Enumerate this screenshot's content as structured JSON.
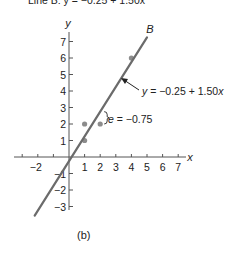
{
  "chart_data": {
    "type": "scatter",
    "title": "",
    "caption": "(b)",
    "xlabel": "x",
    "ylabel": "y",
    "xlim": [
      -3,
      7.5
    ],
    "ylim": [
      -3.5,
      7.5
    ],
    "grid": false,
    "x_ticks": [
      -2,
      -1,
      1,
      2,
      3,
      4,
      5,
      6,
      7
    ],
    "x_tick_labels": [
      "−2",
      "1",
      "2",
      "3",
      "4",
      "5",
      "6",
      "7"
    ],
    "y_ticks": [
      -3,
      -2,
      -1,
      1,
      2,
      3,
      4,
      5,
      6,
      7
    ],
    "y_tick_labels": [
      "−3",
      "−2",
      "−1",
      "1",
      "2",
      "3",
      "4",
      "5",
      "6",
      "7"
    ],
    "points": [
      {
        "x": 1,
        "y": 1
      },
      {
        "x": 1,
        "y": 2
      },
      {
        "x": 2,
        "y": 2
      },
      {
        "x": 4,
        "y": 6
      }
    ],
    "line": {
      "name": "B",
      "intercept": -0.25,
      "slope": 1.5,
      "x_range": [
        -2.2,
        5.0
      ],
      "equation_label": "y = −0.25 + 1.50x"
    },
    "residual_annotation": {
      "x": 2,
      "observed": 2,
      "predicted": 2.75,
      "label": "e = −0.75"
    },
    "colors": {
      "line": "#6b6b6b",
      "points": "#8c8c8c",
      "axes": "#555555",
      "text": "#222222"
    }
  },
  "top_text_cut": "Line B: y = −0.25 + 1.50x",
  "labels": {
    "line_name": "B",
    "y_axis": "y",
    "x_axis": "x",
    "equation_y": "y",
    "equation_rest": " = −0.25 + 1.50",
    "equation_x": "x",
    "residual_e": "e",
    "residual_rest": " = −0.75",
    "caption": "(b)"
  }
}
